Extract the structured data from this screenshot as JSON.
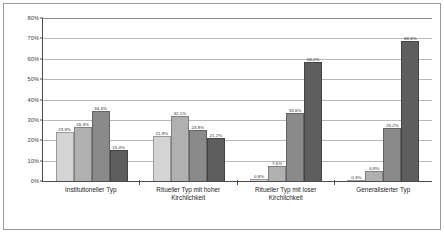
{
  "chart_data": {
    "type": "bar",
    "title": "",
    "xlabel": "",
    "ylabel": "",
    "ylim": [
      0,
      80
    ],
    "ytick_labels": [
      "80%",
      "70%",
      "60%",
      "50%",
      "40%",
      "30%",
      "20%",
      "10%",
      "0%"
    ],
    "ytick_values": [
      80,
      70,
      60,
      50,
      40,
      30,
      20,
      10,
      0
    ],
    "grid": true,
    "legend": "none",
    "categories": [
      "Institutioneller Typ",
      "Ritueller  Typ mit hoher Kirchlichkeit",
      "Ritueller Typ mit loser Kirchlichkeit",
      "Generalisierter Typ"
    ],
    "series": [
      {
        "name": "Serie 1",
        "color": "#d4d4d4",
        "values": [
          23.9,
          21.9,
          0.8,
          0.3
        ]
      },
      {
        "name": "Serie 2",
        "color": "#b0b0b0",
        "values": [
          26.3,
          32.1,
          7.6,
          4.8
        ]
      },
      {
        "name": "Serie 3",
        "color": "#8a8a8a",
        "values": [
          34.4,
          24.8,
          33.6,
          26.2
        ]
      },
      {
        "name": "Serie 4",
        "color": "#5e5e5e",
        "values": [
          15.4,
          21.2,
          58.2,
          68.8
        ]
      }
    ],
    "bar_labels": [
      [
        "23,9%",
        "26,3%",
        "34,4%",
        "15,4%"
      ],
      [
        "21,9%",
        "32,1%",
        "24,8%",
        "21,2%"
      ],
      [
        "0,8%",
        "7,6%",
        "33,6%",
        "58,2%"
      ],
      [
        "0,3%",
        "4,8%",
        "26,2%",
        "68,8%"
      ]
    ]
  }
}
